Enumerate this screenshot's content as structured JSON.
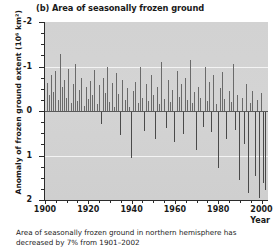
{
  "panel": {
    "label": "(b)",
    "title": "(b) Area of seasonally frozen ground"
  },
  "axes": {
    "ylabel_text": "Anomaly of frozen ground extent (10",
    "ylabel_exponent": "6",
    "ylabel_units": " km",
    "ylabel_units_exp": "2",
    "ylabel_close": ")",
    "ylabel_full": "Anomaly of frozen ground extent (10⁶ km²)",
    "xlabel": "Year",
    "ytick_labels": [
      "2",
      "1",
      "0",
      "-1",
      "-2"
    ],
    "xtick_labels": [
      "1900",
      "1920",
      "1940",
      "1960",
      "1980",
      "2000"
    ]
  },
  "caption": {
    "line1": "Area of seasonally frozen ground in northern",
    "line2": "hemisphere has decreased by 7% from 1901–2002"
  },
  "colors": {
    "plot_background": "#d2d2d2",
    "bar_positive": "#6a6a6a",
    "bar_negative": "#4a4a4a",
    "gridline": "#f3f3f3",
    "zeroline": "#5a5a5a",
    "axis": "#2b2b2b",
    "text": "#1a1a1a"
  },
  "chart_data": {
    "type": "bar",
    "title": "(b) Area of seasonally frozen ground",
    "xlabel": "Year",
    "ylabel": "Anomaly of frozen ground extent (10⁶ km²)",
    "xlim": [
      1900,
      2003
    ],
    "ylim": [
      -2,
      2
    ],
    "yticks": [
      -2,
      -1,
      0,
      1,
      2
    ],
    "xticks": [
      1900,
      1920,
      1940,
      1960,
      1980,
      2000
    ],
    "grid": true,
    "gridlines_y": [
      1,
      -1
    ],
    "zero_line": 0,
    "legend": null,
    "annotation": "Area of seasonally frozen ground in northern hemisphere has decreased by 7% from 1901–2002",
    "x": [
      1901,
      1902,
      1903,
      1904,
      1905,
      1906,
      1907,
      1908,
      1909,
      1910,
      1911,
      1912,
      1913,
      1914,
      1915,
      1916,
      1917,
      1918,
      1919,
      1920,
      1921,
      1922,
      1923,
      1924,
      1925,
      1926,
      1927,
      1928,
      1929,
      1930,
      1931,
      1932,
      1933,
      1934,
      1935,
      1936,
      1937,
      1938,
      1939,
      1940,
      1941,
      1942,
      1943,
      1944,
      1945,
      1946,
      1947,
      1948,
      1949,
      1950,
      1951,
      1952,
      1953,
      1954,
      1955,
      1956,
      1957,
      1958,
      1959,
      1960,
      1961,
      1962,
      1963,
      1964,
      1965,
      1966,
      1967,
      1968,
      1969,
      1970,
      1971,
      1972,
      1973,
      1974,
      1975,
      1976,
      1977,
      1978,
      1979,
      1980,
      1981,
      1982,
      1983,
      1984,
      1985,
      1986,
      1987,
      1988,
      1989,
      1990,
      1991,
      1992,
      1993,
      1994,
      1995,
      1996,
      1997,
      1998,
      1999,
      2000,
      2001,
      2002
    ],
    "values": [
      0.62,
      0.35,
      0.8,
      0.42,
      0.9,
      0.25,
      1.28,
      0.55,
      0.7,
      0.3,
      0.95,
      0.18,
      0.6,
      1.05,
      0.22,
      0.48,
      0.75,
      0.12,
      0.55,
      0.28,
      0.68,
      0.35,
      0.92,
      0.15,
      0.58,
      -0.3,
      0.75,
      0.4,
      1.0,
      0.2,
      0.62,
      0.1,
      0.85,
      0.38,
      -0.55,
      0.7,
      0.25,
      0.52,
      0.08,
      -1.05,
      0.45,
      0.65,
      0.18,
      0.98,
      0.3,
      -0.45,
      0.6,
      0.22,
      0.8,
      0.35,
      -0.62,
      0.55,
      0.15,
      1.1,
      0.28,
      -0.38,
      0.7,
      0.2,
      0.48,
      -0.7,
      0.9,
      0.32,
      0.6,
      -0.52,
      0.75,
      0.25,
      1.15,
      0.18,
      0.42,
      -0.88,
      0.55,
      0.3,
      -0.35,
      0.98,
      0.22,
      0.65,
      -0.48,
      0.8,
      0.15,
      -1.28,
      0.52,
      0.88,
      0.28,
      -0.62,
      0.45,
      0.2,
      1.05,
      -0.42,
      0.35,
      -1.55,
      0.3,
      -0.75,
      0.6,
      -1.85,
      0.18,
      0.45,
      -1.45,
      0.25,
      -1.95,
      0.4,
      -1.62,
      -1.78
    ]
  }
}
